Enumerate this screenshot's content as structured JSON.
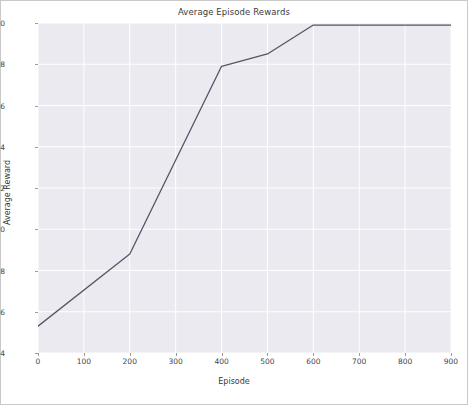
{
  "chart_data": {
    "type": "line",
    "title": "Average Episode Rewards",
    "xlabel": "Episode",
    "ylabel": "Average Reward",
    "xlim": [
      0,
      900
    ],
    "ylim": [
      1.4,
      3.0
    ],
    "xticks": [
      0,
      100,
      200,
      300,
      400,
      500,
      600,
      700,
      800,
      900
    ],
    "xtick_labels": [
      "0",
      "100",
      "200",
      "300",
      "400",
      "500",
      "600",
      "700",
      "800",
      "900"
    ],
    "yticks": [
      1.4,
      1.6,
      1.8,
      2.0,
      2.2,
      2.4,
      2.6,
      2.8,
      3.0
    ],
    "ytick_labels": [
      "1.4",
      "1.6",
      "1.8",
      "2.0",
      "2.2",
      "2.4",
      "2.6",
      "2.8",
      "3.0"
    ],
    "grid": true,
    "legend": null,
    "series": [
      {
        "name": "Average Reward",
        "color": "#555566",
        "x": [
          0,
          200,
          400,
          500,
          600,
          900
        ],
        "values": [
          1.53,
          1.88,
          2.79,
          2.85,
          2.99,
          2.99
        ]
      }
    ]
  },
  "style": {
    "plot_background": "#eaeaf0",
    "grid_color": "#ffffff",
    "figure_background": "#ffffff",
    "text_color": "#3a3a3a",
    "border_color": "#c9c9c9"
  }
}
